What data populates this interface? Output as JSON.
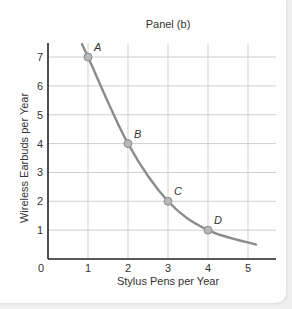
{
  "chart_data": {
    "type": "line",
    "title": "Panel (b)",
    "xlabel": "Stylus Pens per Year",
    "ylabel": "Wireless Earbuds per Year",
    "xlim": [
      0,
      5.7
    ],
    "ylim": [
      0,
      7.5
    ],
    "x_ticks": [
      "0",
      "1",
      "2",
      "3",
      "4",
      "5"
    ],
    "y_ticks": [
      "1",
      "2",
      "3",
      "4",
      "5",
      "6",
      "7"
    ],
    "grid": true,
    "legend": null,
    "series": [
      {
        "name": "curve",
        "x": [
          0.85,
          1,
          2,
          3,
          4,
          5.2
        ],
        "y": [
          7.45,
          7,
          4,
          2,
          1,
          0.5
        ]
      }
    ],
    "points": [
      {
        "label": "A",
        "x": 1,
        "y": 7
      },
      {
        "label": "B",
        "x": 2,
        "y": 4
      },
      {
        "label": "C",
        "x": 3,
        "y": 2
      },
      {
        "label": "D",
        "x": 4,
        "y": 1
      }
    ],
    "colors": {
      "curve": "#8c8c8c",
      "point_fill": "#b8b8b8",
      "point_stroke": "#8c8c8c",
      "grid": "#cfcfcf",
      "axis": "#222222"
    }
  }
}
